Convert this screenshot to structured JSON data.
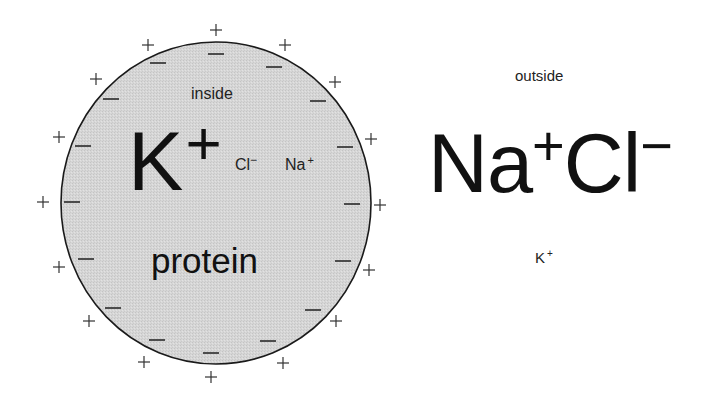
{
  "figure": {
    "inside": {
      "region_label": "inside",
      "major_ion": {
        "symbol": "K",
        "charge": "+"
      },
      "minor_ions": [
        {
          "symbol": "Cl",
          "charge": "−"
        },
        {
          "symbol": "Na",
          "charge": "+"
        }
      ],
      "macromolecule_label": "protein",
      "fill_color": "#d4d4d4",
      "membrane_color": "#1a1a1a"
    },
    "outside": {
      "region_label": "outside",
      "major_ions": [
        {
          "symbol": "Na",
          "charge": "+"
        },
        {
          "symbol": "Cl",
          "charge": "−"
        }
      ],
      "minor_ion": {
        "symbol": "K",
        "charge": "+"
      }
    },
    "membrane_charges": {
      "outer_sign": "+",
      "inner_sign": "−",
      "outer_count": 16,
      "inner_count": 16
    }
  }
}
